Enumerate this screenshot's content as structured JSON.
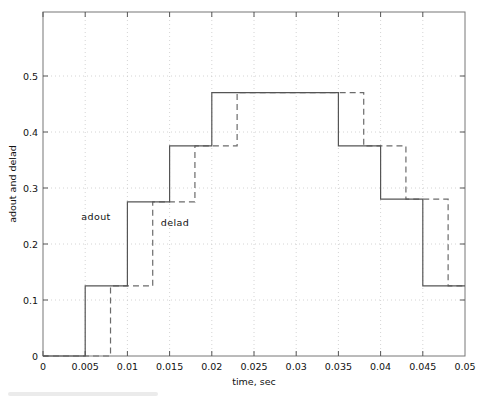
{
  "chart_data": {
    "type": "line",
    "title": "",
    "xlabel": "time, sec",
    "ylabel": "adout and delad",
    "xlim": [
      0,
      0.05
    ],
    "ylim": [
      0,
      0.614
    ],
    "grid": true,
    "legend_position": "inline-annotations",
    "xticks": [
      "0",
      "0.005",
      "0.01",
      "0.015",
      "0.02",
      "0.025",
      "0.03",
      "0.035",
      "0.04",
      "0.045",
      "0.05"
    ],
    "xtick_values": [
      0,
      0.005,
      0.01,
      0.015,
      0.02,
      0.025,
      0.03,
      0.035,
      0.04,
      0.045,
      0.05
    ],
    "yticks": [
      "0",
      "0.1",
      "0.2",
      "0.3",
      "0.4",
      "0.5"
    ],
    "ytick_values": [
      0,
      0.1,
      0.2,
      0.3,
      0.4,
      0.5
    ],
    "annotations": [
      {
        "text": "adout",
        "x": 0.0085,
        "y": 0.235
      },
      {
        "text": "delad",
        "x": 0.0155,
        "y": 0.225
      }
    ],
    "series": [
      {
        "name": "adout",
        "style": "solid",
        "color": "#555555",
        "x": [
          0,
          0.005,
          0.005,
          0.01,
          0.01,
          0.015,
          0.015,
          0.02,
          0.02,
          0.035,
          0.035,
          0.04,
          0.04,
          0.045,
          0.045,
          0.05
        ],
        "y": [
          0,
          0,
          0.125,
          0.125,
          0.275,
          0.275,
          0.375,
          0.375,
          0.47,
          0.47,
          0.375,
          0.375,
          0.28,
          0.28,
          0.125,
          0.125
        ]
      },
      {
        "name": "delad",
        "style": "dashed",
        "color": "#6b6b6b",
        "x": [
          0,
          0.008,
          0.008,
          0.013,
          0.013,
          0.018,
          0.018,
          0.023,
          0.023,
          0.038,
          0.038,
          0.043,
          0.043,
          0.048,
          0.048,
          0.05
        ],
        "y": [
          0,
          0,
          0.125,
          0.125,
          0.275,
          0.275,
          0.375,
          0.375,
          0.47,
          0.47,
          0.375,
          0.375,
          0.28,
          0.28,
          0.125,
          0.125
        ]
      }
    ]
  },
  "axes": {
    "ylabel": "adout and delad",
    "xlabel": "time, sec"
  },
  "colors": {
    "solid_series": "#555555",
    "dashed_series": "#6b6b6b",
    "grid": "#c9c9c9",
    "axis": "#777777",
    "background": "#ffffff"
  }
}
